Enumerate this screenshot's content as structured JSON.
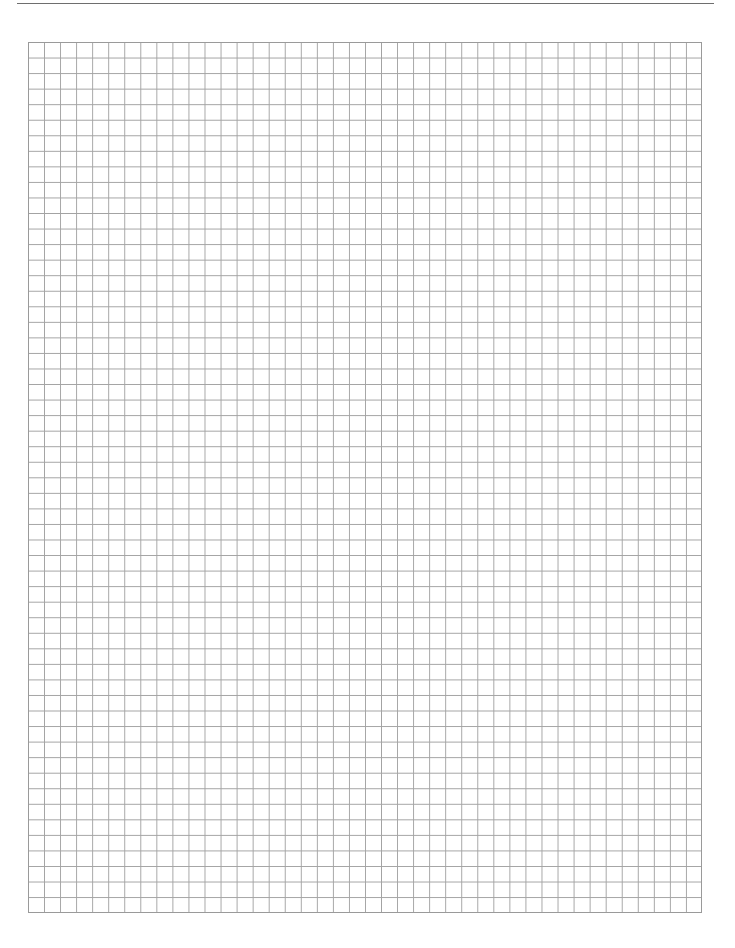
{
  "page": {
    "type": "graph-paper",
    "header": {
      "rule": true,
      "page_number": ""
    },
    "grid": {
      "columns": 42,
      "rows": 56,
      "line_color": "#a3a3a3",
      "border_color": "#9a9a9a",
      "background_color": "#ffffff"
    }
  }
}
